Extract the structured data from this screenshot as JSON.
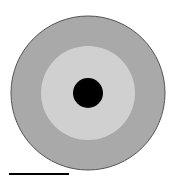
{
  "diagram": {
    "type": "concentric-circles",
    "background": "#ffffff",
    "rings": [
      {
        "name": "outer-ring",
        "cx": 88,
        "cy": 93,
        "r": 77,
        "fill": "#a9a9a9",
        "stroke": "#555555"
      },
      {
        "name": "middle-ring",
        "cx": 88,
        "cy": 93,
        "r": 47,
        "fill": "#d0d0d0",
        "stroke": "none"
      },
      {
        "name": "center-dot",
        "cx": 88,
        "cy": 93,
        "r": 15,
        "fill": "#000000",
        "stroke": "none"
      }
    ],
    "scale_bar": {
      "x1": 9,
      "x2": 69,
      "y": 174,
      "thickness": 2,
      "color": "#000000"
    }
  }
}
